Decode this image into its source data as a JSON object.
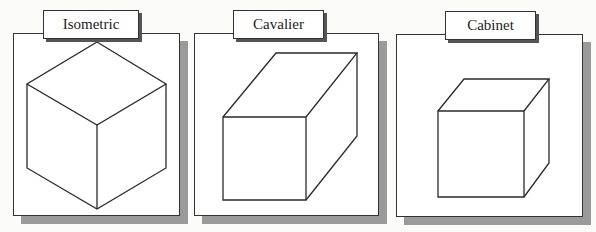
{
  "panels": [
    {
      "label": "Isometric",
      "projection": "isometric",
      "frame": {
        "x": 13,
        "y": 33,
        "w": 167,
        "h": 183
      },
      "label_box": {
        "x": 43,
        "y": 10,
        "w": 96,
        "h": 29
      }
    },
    {
      "label": "Cavalier",
      "projection": "cavalier",
      "frame": {
        "x": 194,
        "y": 33,
        "w": 185,
        "h": 183
      },
      "label_box": {
        "x": 233,
        "y": 10,
        "w": 91,
        "h": 29
      }
    },
    {
      "label": "Cabinet",
      "projection": "cabinet",
      "frame": {
        "x": 396,
        "y": 34,
        "w": 187,
        "h": 183
      },
      "label_box": {
        "x": 445,
        "y": 11,
        "w": 91,
        "h": 29
      }
    }
  ],
  "colors": {
    "stroke": "#2a2a2a",
    "shadow": "#9a9a9a",
    "background": "#fbfbfa"
  }
}
